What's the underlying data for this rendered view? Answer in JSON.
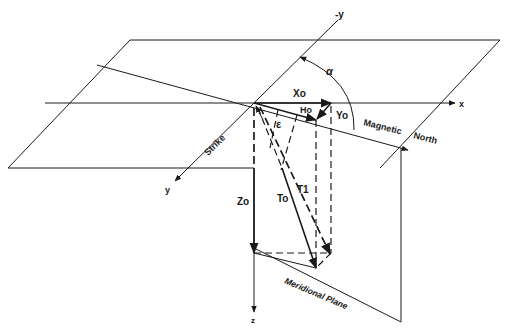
{
  "figure": {
    "type": "3D vector diagram",
    "labels": {
      "neg_y_axis": "-y",
      "x_axis": "x",
      "y_axis": "y",
      "z_axis": "z",
      "alpha": "α",
      "epsilon": "ε",
      "x_component": "Xo",
      "y_component": "Yo",
      "h_component": "Ho",
      "z_component": "Zo",
      "t_zero": "To",
      "t_one": "T1",
      "strike": "Strike",
      "magnetic": "Magnetic",
      "north": "North",
      "meridional_plane": "Meridional Plane"
    },
    "colors": {
      "ink": "#1a1a1a",
      "background": "#ffffff"
    }
  }
}
